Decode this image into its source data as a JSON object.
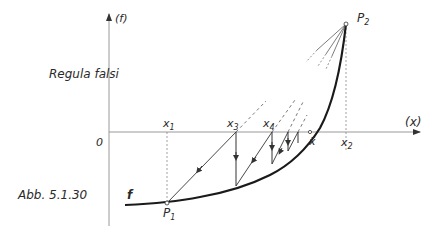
{
  "diagram": {
    "title": "Regula falsi",
    "caption": "Abb. 5.1.30",
    "axes": {
      "y_label": "(f)",
      "x_label": "(x)",
      "origin_label": "0"
    },
    "points": {
      "P1": {
        "base": "P",
        "sub": "1"
      },
      "P2": {
        "base": "P",
        "sub": "2"
      }
    },
    "x_marks": {
      "x1": {
        "base": "x",
        "sub": "1"
      },
      "x3": {
        "base": "x",
        "sub": "3"
      },
      "x4": {
        "base": "x",
        "sub": "4"
      },
      "xbar": {
        "base": "x̄",
        "sub": ""
      },
      "x2": {
        "base": "x",
        "sub": "2"
      }
    },
    "curve_label": "f",
    "colors": {
      "ink": "#1a1a1a",
      "axis": "#9a9a9a",
      "background": "#ffffff"
    }
  }
}
